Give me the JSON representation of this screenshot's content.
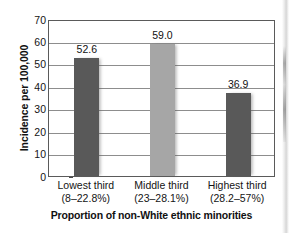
{
  "chart_data": {
    "type": "bar",
    "title": "",
    "xlabel": "Proportion of non-White ethnic minorities",
    "ylabel": "Incidence per 100,000",
    "categories": [
      "Lowest third",
      "Middle third",
      "Highest third"
    ],
    "category_sublabels": [
      "(8–22.8%)",
      "(23–28.1%)",
      "(28.2–57%)"
    ],
    "values": [
      52.6,
      59.0,
      36.9
    ],
    "value_labels": [
      "52.6",
      "59.0",
      "36.9"
    ],
    "bar_colors": [
      "#595959",
      "#a6a6a6",
      "#595959"
    ],
    "ylim": [
      0,
      70
    ],
    "yticks": [
      0,
      10,
      20,
      30,
      40,
      50,
      60,
      70
    ],
    "ytick_labels": [
      "0",
      "10",
      "20",
      "30",
      "40",
      "50",
      "60",
      "70"
    ],
    "grid": true,
    "grid_axis": "y",
    "legend": "none",
    "legend_position": "none",
    "frame": true
  },
  "style": {
    "background": "#ffffff",
    "axis_color": "#5a5a5a",
    "grid_color": "#8d8d8d",
    "text_color": "#141414"
  }
}
